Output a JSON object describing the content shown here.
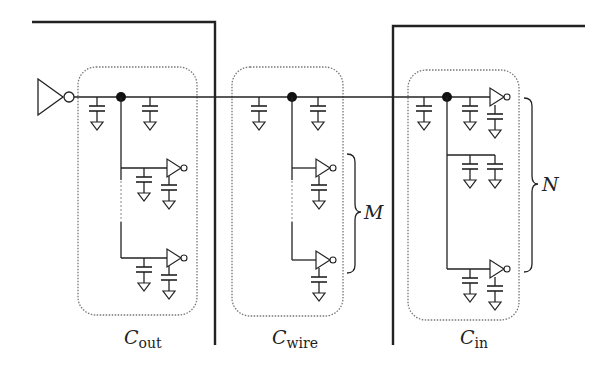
{
  "diagram": {
    "type": "circuit-schematic",
    "groups": [
      {
        "id": "cout",
        "label_main": "C",
        "label_sub": "out",
        "fanout_stages": 2
      },
      {
        "id": "cwire",
        "label_main": "C",
        "label_sub": "wire",
        "fanout_stages": 2,
        "brace_label": "M"
      },
      {
        "id": "cin",
        "label_main": "C",
        "label_sub": "in",
        "fanout_stages": 2,
        "brace_label": "N"
      }
    ],
    "braces": [
      {
        "label": "M"
      },
      {
        "label": "N"
      }
    ],
    "colors": {
      "stroke": "#222222",
      "dotted_box": "#777777",
      "background": "#ffffff"
    }
  }
}
